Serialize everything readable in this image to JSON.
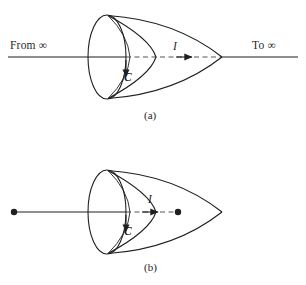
{
  "figure": {
    "stroke_color": "#1f1f1f",
    "background": "#ffffff",
    "panels": [
      {
        "id": "a",
        "caption": "(a)",
        "labels": {
          "left_wire": "From ∞",
          "right_wire": "To ∞",
          "current": "I",
          "contour": "C"
        },
        "geometry": {
          "axis_y": 57,
          "axis_left_x": 8,
          "axis_right_x": 298,
          "ellipse_center_x": 107,
          "ellipse_rx": 19,
          "ellipse_ry": 42,
          "inner_curve_x": 155,
          "tip_x": 222,
          "dash_start_x": 126,
          "dash_end_x": 222,
          "arrow_x": 190
        }
      },
      {
        "id": "b",
        "caption": "(b)",
        "labels": {
          "current": "I",
          "contour": "C"
        },
        "geometry": {
          "axis_y": 212,
          "axis_left_x": 14,
          "ellipse_center_x": 107,
          "ellipse_rx": 19,
          "ellipse_ry": 42,
          "inner_curve_x": 155,
          "tip_x": 222,
          "dash_start_x": 126,
          "dash_end_x": 178,
          "arrow_x": 158,
          "left_endpoint_x": 14,
          "right_endpoint_x": 178,
          "endpoint_radius": 3.2
        }
      }
    ]
  }
}
